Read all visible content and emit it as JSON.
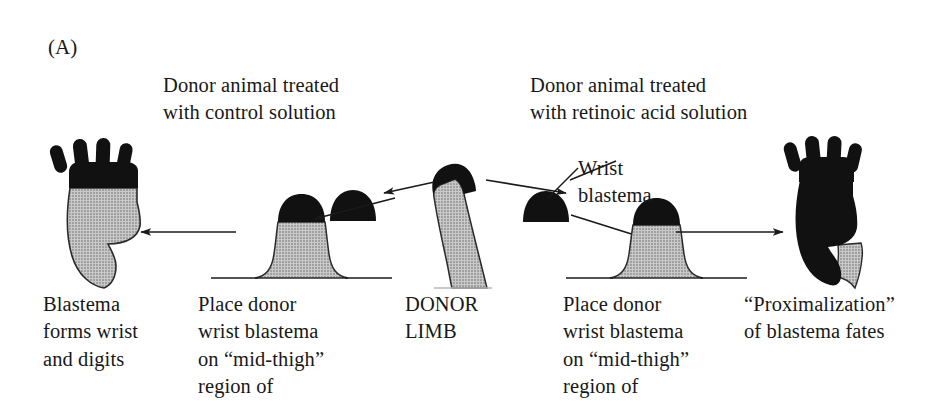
{
  "figure": {
    "panel_label": "(A)",
    "background_color": "#ffffff",
    "ink_color": "#181818",
    "grey_fill_color": "#b5b5b5",
    "black_fill_color": "#111111"
  },
  "headers": {
    "control": "Donor animal treated\nwith control solution",
    "retinoic_acid": "Donor animal treated\nwith retinoic acid solution"
  },
  "annotations": {
    "wrist_blastema": "Wrist\nblastema"
  },
  "captions": {
    "left": "Blastema\nforms wrist\nand digits",
    "mid_left": "Place donor\nwrist blastema\non “mid-thigh”\nregion of",
    "center": "DONOR\nLIMB",
    "mid_right": "Place donor\nwrist blastema\non “mid-thigh”\nregion of",
    "right": "“Proximalization”\nof blastema fates"
  },
  "diagram_elements": {
    "donor_limb": "grey tapering limb with black wrist blastema cap",
    "free_blastema_left": "black dome blastema in transit to left host",
    "free_blastema_right": "black dome blastema in transit to right host",
    "host_thigh_left": "grey flared thigh stump with black blastema cap on ground line",
    "host_thigh_right": "grey flared thigh stump with black blastema cap on ground line",
    "result_left": "grey curved limb topped by black hand with four digits",
    "result_right": "fully black proximalized limb with hand, grey base"
  },
  "arrows": [
    {
      "name": "donor-to-left-blastema",
      "direction": "left",
      "style": "solid-line-with-filled-head"
    },
    {
      "name": "left-blastema-to-host",
      "direction": "left-down",
      "style": "solid-line-with-filled-head"
    },
    {
      "name": "left-host-to-result",
      "direction": "left",
      "style": "solid-line-with-filled-head"
    },
    {
      "name": "donor-to-right-blastema",
      "direction": "right",
      "style": "solid-line-with-filled-head"
    },
    {
      "name": "right-blastema-to-host",
      "direction": "right-down",
      "style": "solid-line-with-filled-head"
    },
    {
      "name": "right-host-to-result",
      "direction": "right",
      "style": "solid-line-with-filled-head"
    }
  ]
}
